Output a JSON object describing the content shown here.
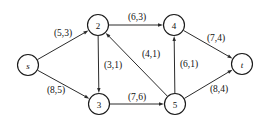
{
  "figure": {
    "width": 267,
    "height": 126,
    "background_color": "#ffffff",
    "line_color": "#2b2b2b",
    "text_color": "#111111"
  },
  "chart_data": {
    "type": "diagram",
    "subtype": "directed-graph",
    "title": "",
    "node_radius": 10.5,
    "label_format": "(capacity,flow)",
    "nodes": [
      {
        "id": "s",
        "label": "s",
        "x": 28,
        "y": 65,
        "italic": true
      },
      {
        "id": "2",
        "label": "2",
        "x": 98,
        "y": 25,
        "italic": false
      },
      {
        "id": "3",
        "label": "3",
        "x": 99,
        "y": 104,
        "italic": false
      },
      {
        "id": "4",
        "label": "4",
        "x": 174,
        "y": 25,
        "italic": false
      },
      {
        "id": "5",
        "label": "5",
        "x": 175,
        "y": 104,
        "italic": false
      },
      {
        "id": "t",
        "label": "t",
        "x": 242,
        "y": 64,
        "italic": true
      }
    ],
    "edges": [
      {
        "from": "s",
        "to": "2",
        "label": "(5,3)",
        "capacity": 5,
        "flow": 3,
        "label_x": 63,
        "label_y": 33
      },
      {
        "from": "s",
        "to": "3",
        "label": "(8,5)",
        "capacity": 8,
        "flow": 5,
        "label_x": 56,
        "label_y": 90
      },
      {
        "from": "2",
        "to": "4",
        "label": "(6,3)",
        "capacity": 6,
        "flow": 3,
        "label_x": 137,
        "label_y": 17
      },
      {
        "from": "2",
        "to": "3",
        "label": "(3,1)",
        "capacity": 3,
        "flow": 1,
        "label_x": 113,
        "label_y": 65
      },
      {
        "from": "5",
        "to": "2",
        "label": "(4,1)",
        "capacity": 4,
        "flow": 1,
        "label_x": 151,
        "label_y": 54
      },
      {
        "from": "3",
        "to": "5",
        "label": "(7,6)",
        "capacity": 7,
        "flow": 6,
        "label_x": 137,
        "label_y": 97
      },
      {
        "from": "5",
        "to": "4",
        "label": "(6,1)",
        "capacity": 6,
        "flow": 1,
        "label_x": 189,
        "label_y": 64
      },
      {
        "from": "4",
        "to": "t",
        "label": "(7,4)",
        "capacity": 7,
        "flow": 4,
        "label_x": 216,
        "label_y": 38
      },
      {
        "from": "5",
        "to": "t",
        "label": "(8,4)",
        "capacity": 8,
        "flow": 4,
        "label_x": 219,
        "label_y": 89
      }
    ]
  }
}
